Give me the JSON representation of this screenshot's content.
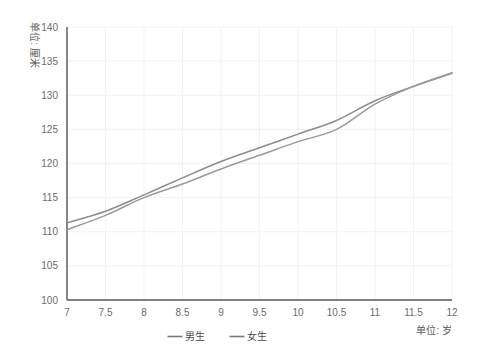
{
  "chart_data": {
    "type": "line",
    "title": "",
    "subtitle": "",
    "xlabel": "单位: 岁",
    "ylabel": "单位: 厘米",
    "xlim": [
      7,
      12
    ],
    "ylim": [
      100,
      140
    ],
    "xticks": [
      "7",
      "7.5",
      "8",
      "8.5",
      "9",
      "9.5",
      "10",
      "10.5",
      "11",
      "11.5",
      "12"
    ],
    "xtick_values": [
      7,
      7.5,
      8,
      8.5,
      9,
      9.5,
      10,
      10.5,
      11,
      11.5,
      12
    ],
    "yticks": [
      "100",
      "105",
      "110",
      "115",
      "120",
      "125",
      "130",
      "135",
      "140"
    ],
    "ytick_values": [
      100,
      105,
      110,
      115,
      120,
      125,
      130,
      135,
      140
    ],
    "grid": true,
    "legend_position": "bottom",
    "x": [
      7,
      7.5,
      8,
      8.5,
      9,
      9.5,
      10,
      10.5,
      11,
      11.5,
      12
    ],
    "series": [
      {
        "name": "男生",
        "color": "#8c8c8c",
        "values": [
          111.3,
          113.0,
          115.4,
          117.9,
          120.3,
          122.3,
          124.3,
          126.3,
          129.2,
          131.3,
          133.2
        ]
      },
      {
        "name": "女生",
        "color": "#9a9a9a",
        "values": [
          110.3,
          112.4,
          115.0,
          117.0,
          119.2,
          121.2,
          123.2,
          125.0,
          128.7,
          131.3,
          133.3
        ]
      }
    ],
    "colors": {
      "axis": "#555555",
      "grid": "#f2f2f2",
      "tick_text": "#6b6b6b",
      "background": "#ffffff"
    }
  }
}
